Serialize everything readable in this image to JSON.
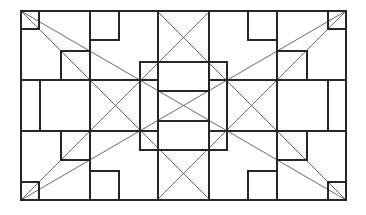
{
  "diagram": {
    "title": "",
    "colors": {
      "background": "#ffffff",
      "structure": "#262626",
      "diagonal": "#6a6a6a"
    },
    "stroke": {
      "structure": 2,
      "diagonal": 1
    },
    "outer_frame": {
      "x1": 21,
      "y1": 11,
      "x2": 346,
      "y2": 200
    },
    "center_frame": {
      "x1": 140,
      "y1": 62,
      "x2": 227,
      "y2": 150
    },
    "structure_lines": [
      {
        "x1": 21,
        "y1": 80,
        "x2": 158,
        "y2": 80
      },
      {
        "x1": 209,
        "y1": 80,
        "x2": 346,
        "y2": 80
      },
      {
        "x1": 21,
        "y1": 131,
        "x2": 158,
        "y2": 131
      },
      {
        "x1": 209,
        "y1": 131,
        "x2": 346,
        "y2": 131
      },
      {
        "x1": 158,
        "y1": 91,
        "x2": 209,
        "y2": 91
      },
      {
        "x1": 158,
        "y1": 121,
        "x2": 209,
        "y2": 121
      },
      {
        "x1": 90,
        "y1": 11,
        "x2": 90,
        "y2": 200
      },
      {
        "x1": 277,
        "y1": 11,
        "x2": 277,
        "y2": 200
      },
      {
        "x1": 158,
        "y1": 11,
        "x2": 158,
        "y2": 200
      },
      {
        "x1": 209,
        "y1": 11,
        "x2": 209,
        "y2": 200
      },
      {
        "x1": 40,
        "y1": 80,
        "x2": 40,
        "y2": 131
      },
      {
        "x1": 328,
        "y1": 80,
        "x2": 328,
        "y2": 131
      }
    ],
    "boxes": [
      {
        "name": "corner-box-top-left",
        "x1": 21,
        "y1": 11,
        "x2": 39,
        "y2": 29
      },
      {
        "name": "corner-box-top-right",
        "x1": 328,
        "y1": 11,
        "x2": 346,
        "y2": 29
      },
      {
        "name": "corner-box-bottom-left",
        "x1": 21,
        "y1": 182,
        "x2": 39,
        "y2": 200
      },
      {
        "name": "corner-box-bottom-right",
        "x1": 328,
        "y1": 182,
        "x2": 346,
        "y2": 200
      },
      {
        "name": "box-top-inner-left",
        "x1": 90,
        "y1": 11,
        "x2": 119,
        "y2": 40
      },
      {
        "name": "box-top-inner-right",
        "x1": 248,
        "y1": 11,
        "x2": 277,
        "y2": 40
      },
      {
        "name": "box-upper-left",
        "x1": 61,
        "y1": 51,
        "x2": 90,
        "y2": 80
      },
      {
        "name": "box-upper-right",
        "x1": 277,
        "y1": 51,
        "x2": 307,
        "y2": 80
      },
      {
        "name": "box-lower-left",
        "x1": 61,
        "y1": 131,
        "x2": 90,
        "y2": 160
      },
      {
        "name": "box-lower-right",
        "x1": 277,
        "y1": 131,
        "x2": 307,
        "y2": 160
      },
      {
        "name": "box-bottom-inner-left",
        "x1": 90,
        "y1": 171,
        "x2": 119,
        "y2": 200
      },
      {
        "name": "box-bottom-inner-right",
        "x1": 248,
        "y1": 171,
        "x2": 277,
        "y2": 200
      }
    ],
    "diagonals": [
      {
        "name": "main-diagonal-descending",
        "x1": 21,
        "y1": 11,
        "x2": 346,
        "y2": 200
      },
      {
        "name": "main-diagonal-ascending",
        "x1": 21,
        "y1": 200,
        "x2": 346,
        "y2": 11
      },
      {
        "name": "diagonal-45-left-descending",
        "x1": 21,
        "y1": 11,
        "x2": 210,
        "y2": 200
      },
      {
        "name": "diagonal-45-right-descending",
        "x1": 157,
        "y1": 11,
        "x2": 346,
        "y2": 200
      },
      {
        "name": "diagonal-45-left-ascending",
        "x1": 21,
        "y1": 200,
        "x2": 210,
        "y2": 11
      },
      {
        "name": "diagonal-45-right-ascending",
        "x1": 157,
        "y1": 200,
        "x2": 346,
        "y2": 11
      }
    ]
  }
}
